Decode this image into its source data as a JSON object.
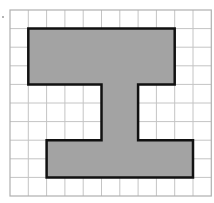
{
  "figure": {
    "type": "grid-shape",
    "grid": {
      "columns": 11,
      "rows": 10,
      "origin_px": [
        10,
        10
      ],
      "cell_w_px": 18.3,
      "cell_h_px": 18.6,
      "line_color": "#c4c4c4",
      "border_color": "#b0b0b0"
    },
    "shape": {
      "fill_color": "#a3a3a3",
      "stroke_color": "#111111",
      "stroke_width": 2.5,
      "vertices_cells": [
        [
          1,
          1
        ],
        [
          9,
          1
        ],
        [
          9,
          4
        ],
        [
          7,
          4
        ],
        [
          7,
          7
        ],
        [
          10,
          7
        ],
        [
          10,
          9
        ],
        [
          2,
          9
        ],
        [
          2,
          7
        ],
        [
          5,
          7
        ],
        [
          5,
          4
        ],
        [
          1,
          4
        ]
      ]
    },
    "marker": {
      "x": 3,
      "y": 17,
      "color": "#9a9a9a"
    }
  }
}
